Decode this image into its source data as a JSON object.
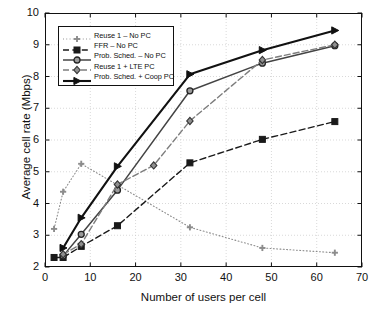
{
  "chart_data": {
    "type": "line",
    "title": "",
    "xlabel": "Number of users per cell",
    "ylabel": "Average cell rate (Mbps)",
    "xlim": [
      0,
      70
    ],
    "ylim": [
      2,
      10
    ],
    "xticks": [
      0,
      10,
      20,
      30,
      40,
      50,
      60,
      70
    ],
    "yticks": [
      2,
      3,
      4,
      5,
      6,
      7,
      8,
      9,
      10
    ],
    "grid": true,
    "legend_position": "upper left",
    "series": [
      {
        "name": "Reuse 1 – No PC",
        "marker": "plus",
        "linestyle": "dotted",
        "color": "#8c8c8c",
        "x": [
          2,
          4,
          8,
          32,
          48,
          64
        ],
        "values": [
          3.2,
          4.37,
          5.25,
          3.25,
          2.6,
          2.45
        ]
      },
      {
        "name": "FFR – No PC",
        "marker": "square",
        "linestyle": "dashed",
        "color": "#1a1a1a",
        "x": [
          2,
          4,
          8,
          16,
          32,
          48,
          64
        ],
        "values": [
          2.3,
          2.3,
          2.65,
          3.3,
          5.28,
          6.02,
          6.58
        ]
      },
      {
        "name": "Prob. Sched. – No PC",
        "marker": "circle",
        "linestyle": "solid",
        "color": "#444444",
        "x": [
          4,
          8,
          16,
          32,
          48,
          64
        ],
        "values": [
          2.35,
          3.03,
          4.42,
          7.55,
          8.42,
          8.97
        ]
      },
      {
        "name": "Reuse 1 + LTE PC",
        "marker": "diamond",
        "linestyle": "dashdot",
        "color": "#7d7d7d",
        "x": [
          4,
          8,
          16,
          24,
          32,
          48,
          64
        ],
        "values": [
          2.4,
          2.72,
          4.6,
          5.2,
          6.6,
          8.52,
          9.0
        ]
      },
      {
        "name": "Prob. Sched. + Coop PC",
        "marker": "triangle-right",
        "linestyle": "solid-bold",
        "color": "#111111",
        "x": [
          4,
          8,
          16,
          32,
          48,
          64
        ],
        "values": [
          2.6,
          3.55,
          5.17,
          8.07,
          8.83,
          9.45
        ]
      }
    ]
  },
  "axis": {
    "ytick_labels": [
      "2",
      "3",
      "4",
      "5",
      "6",
      "7",
      "8",
      "9",
      "10"
    ],
    "xtick_labels": [
      "0",
      "10",
      "20",
      "30",
      "40",
      "50",
      "60",
      "70"
    ]
  },
  "legend": {
    "items": [
      "Reuse 1 – No PC",
      "FFR – No PC",
      "Prob. Sched. – No PC",
      "Reuse 1 + LTE PC",
      "Prob. Sched. + Coop PC"
    ]
  }
}
